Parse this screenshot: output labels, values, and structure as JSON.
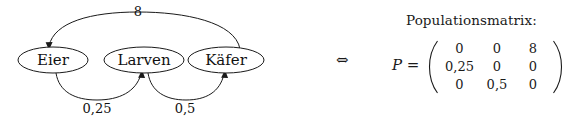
{
  "figure": {
    "graph": {
      "nodes": [
        {
          "id": "eier",
          "label": "Eier",
          "cx": 53,
          "cy": 60,
          "rx": 35,
          "ry": 13
        },
        {
          "id": "larven",
          "label": "Larven",
          "cx": 144,
          "cy": 60,
          "rx": 40,
          "ry": 13
        },
        {
          "id": "kaefer",
          "label": "Käfer",
          "cx": 226,
          "cy": 60,
          "rx": 38,
          "ry": 13
        }
      ],
      "edges": [
        {
          "id": "kaefer-to-eier",
          "from": "kaefer",
          "to": "eier",
          "label": "8",
          "label_x": 138,
          "label_y": 16,
          "side": "top"
        },
        {
          "id": "eier-to-larven",
          "from": "eier",
          "to": "larven",
          "label": "0,25",
          "label_x": 97,
          "label_y": 113,
          "side": "bottom"
        },
        {
          "id": "larven-to-kaefer",
          "from": "larven",
          "to": "kaefer",
          "label": "0,5",
          "label_x": 185,
          "label_y": 113,
          "side": "bottom"
        }
      ],
      "stroke_color": "#1a1a1a",
      "fill_color": "#ffffff"
    },
    "matrix_panel": {
      "title": "Populationsmatrix:",
      "equivalence_symbol": "⇔",
      "matrix_name": "P",
      "equals_sign": "=",
      "matrix_label": "P =",
      "rows": [
        [
          "0",
          "0",
          "8"
        ],
        [
          "0,25",
          "0",
          "0"
        ],
        [
          "0",
          "0,5",
          "0"
        ]
      ]
    }
  }
}
